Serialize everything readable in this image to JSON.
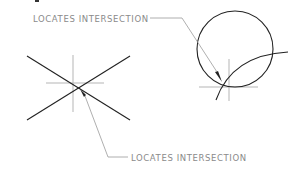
{
  "diagram": {
    "labels": {
      "top": "LOCATES INTERSECTION",
      "bottom": "LOCATES INTERSECTION"
    },
    "colors": {
      "geometry": "#222222",
      "centerlines": "#b5b5b5",
      "leaders": "#9a9a9a",
      "text": "#8a8a8a",
      "background": "#ffffff"
    },
    "figures": [
      {
        "name": "crossing-lines",
        "description": "Two straight lines crossing, with centerline crosshair and arrow marking the intersection"
      },
      {
        "name": "circle-and-arc",
        "description": "Circle intersected by an arc, with centerline crosshair and arrow marking the intersection"
      }
    ]
  }
}
